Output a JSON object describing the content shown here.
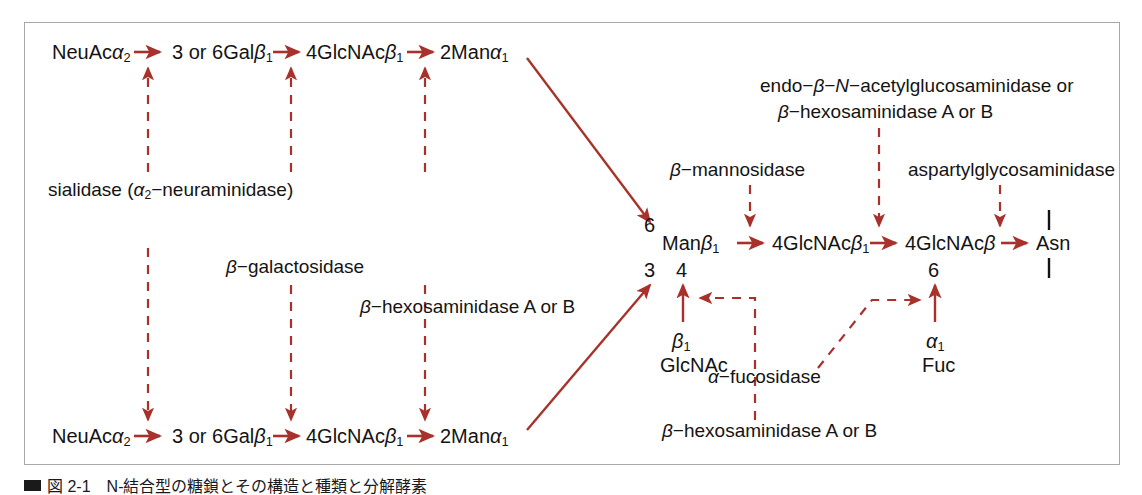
{
  "figure": {
    "frame_color": "#a8a8a8",
    "accent_color": "#a8322b",
    "text_color": "#141414",
    "caption": "図 2-1　N-結合型の糖鎖とその構造と種類と分解酵素"
  },
  "chains": {
    "top_row": [
      {
        "id": "top-neuac",
        "text": "NeuAcα2"
      },
      {
        "id": "top-gal",
        "text": "3 or 6Galβ1"
      },
      {
        "id": "top-glcnac",
        "text": "4GlcNAcβ1"
      },
      {
        "id": "top-man",
        "text": "2Manα1"
      }
    ],
    "bottom_row": [
      {
        "id": "bot-neuac",
        "text": "NeuAcα2"
      },
      {
        "id": "bot-gal",
        "text": "3 or 6Galβ1"
      },
      {
        "id": "bot-glcnac",
        "text": "4GlcNAcβ1"
      },
      {
        "id": "bot-man",
        "text": "2Manα1"
      }
    ],
    "core_row": [
      {
        "id": "core-man",
        "text": "Manβ1"
      },
      {
        "id": "core-glcnac1",
        "text": "4GlcNAcβ1"
      },
      {
        "id": "core-glcnac2",
        "text": "4GlcNAcβ"
      },
      {
        "id": "core-asn",
        "text": "Asn"
      }
    ],
    "branch_nodes": [
      {
        "id": "bisect-link",
        "text": "β1"
      },
      {
        "id": "bisect-sugar",
        "text": "GlcNAc"
      },
      {
        "id": "fuc-link",
        "text": "α1"
      },
      {
        "id": "fuc-sugar",
        "text": "Fuc"
      }
    ],
    "linkage_numbers": [
      {
        "id": "num-6-upper",
        "text": "6"
      },
      {
        "id": "num-3-lower",
        "text": "3"
      },
      {
        "id": "num-4-bisect",
        "text": "4"
      },
      {
        "id": "num-6-fuc",
        "text": "6"
      }
    ]
  },
  "enzymes": {
    "sialidase": "sialidase (α2−neuraminidase)",
    "galactosidase": "β−galactosidase",
    "hexosaminidase_left": "β−hexosaminidase A or B",
    "hexosaminidase_bottom": "β−hexosaminidase A or B",
    "mannosidase": "β−mannosidase",
    "endo_line1": "endo−β−N−acetylglucosaminidase or",
    "endo_line2": "β−hexosaminidase A or B",
    "aspartyl": "aspartylglycosaminidase",
    "fucosidase": "α−fucosidase"
  }
}
